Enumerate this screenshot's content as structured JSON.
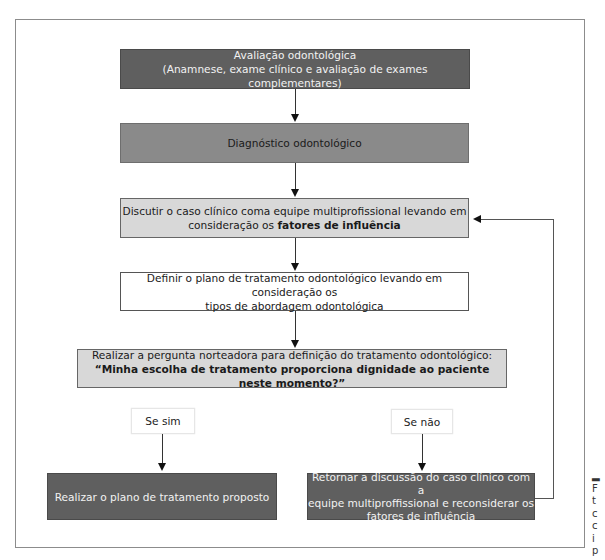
{
  "diagram": {
    "type": "flowchart",
    "nodes": [
      {
        "id": "evaluation",
        "line1": "Avaliação odontológica",
        "line2": "(Anamnese, exame clínico e avaliação de exames complementares)",
        "fill": "#5f5f5f"
      },
      {
        "id": "diagnosis",
        "text": "Diagnóstico odontológico",
        "fill": "#8a8a8a"
      },
      {
        "id": "discuss",
        "line1": "Discutir o caso clínico coma equipe multiprofissional levando em",
        "line2_prefix": "consideração os ",
        "line2_bold": "fatores de influência",
        "fill": "#d8d8d8"
      },
      {
        "id": "define-plan",
        "line1": "Definir o plano de tratamento odontológico levando em consideração  os",
        "line2": "tipos de abordagem odontológica",
        "fill": "#ffffff"
      },
      {
        "id": "guiding-question",
        "line1": "Realizar a pergunta norteadora para definição do tratamento odontológico:",
        "line2_bold": "“Minha escolha de tratamento proporciona dignidade ao paciente neste momento?”",
        "fill": "#d8d8d8"
      },
      {
        "id": "execute-plan",
        "text": "Realizar o plano de tratamento proposto",
        "fill": "#5f5f5f"
      },
      {
        "id": "return-discussion",
        "line1": "Retornar a discussão do caso clínico com a",
        "line2": "equipe multiproffissional e reconsiderar os",
        "line3": "fatores de influência",
        "fill": "#5f5f5f"
      }
    ],
    "branch_labels": {
      "yes": "Se sim",
      "no": "Se não"
    },
    "edges": [
      {
        "from": "evaluation",
        "to": "diagnosis"
      },
      {
        "from": "diagnosis",
        "to": "discuss"
      },
      {
        "from": "discuss",
        "to": "define-plan"
      },
      {
        "from": "define-plan",
        "to": "guiding-question"
      },
      {
        "from": "guiding-question",
        "to": "execute-plan",
        "label": "Se sim"
      },
      {
        "from": "guiding-question",
        "to": "return-discussion",
        "label": "Se não"
      },
      {
        "from": "return-discussion",
        "to": "discuss",
        "label": "feedback loop"
      }
    ]
  },
  "caption_fragment": [
    "",
    "F",
    "t",
    "c",
    "c",
    "i",
    "p"
  ]
}
